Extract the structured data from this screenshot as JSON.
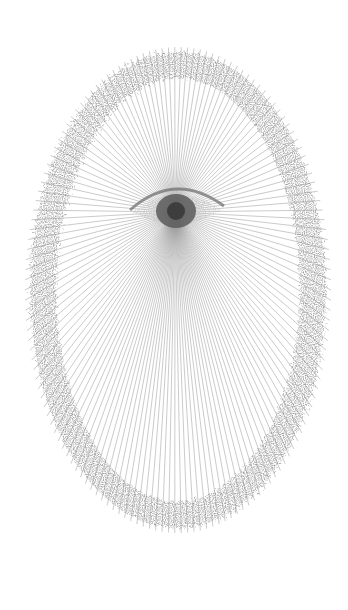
{
  "artwork": {
    "description": "Radial string-art of an eye surrounded by a textured oval ring",
    "background": "#ffffff",
    "line_color": "#8a8a8a",
    "ring_color": "#9a9a9a",
    "eye_color": "#555555",
    "center": {
      "x": 175,
      "y": 212
    },
    "ring": {
      "cx": 178,
      "cy": 290,
      "rx": 135,
      "ry": 225,
      "thickness": 26
    },
    "ray_count": 150
  }
}
